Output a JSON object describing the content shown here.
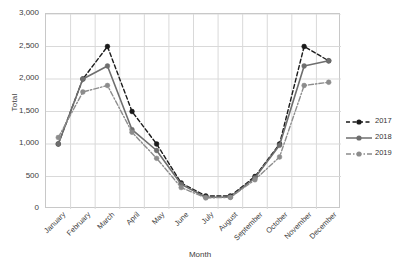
{
  "chart_data": {
    "type": "line",
    "title": "",
    "xlabel": "Month",
    "ylabel": "Total",
    "categories": [
      "January",
      "February",
      "March",
      "April",
      "May",
      "June",
      "July",
      "August",
      "September",
      "October",
      "November",
      "December"
    ],
    "ylim": [
      0,
      3000
    ],
    "ytick_step": 500,
    "ytick_labels": [
      "0",
      "500",
      "1,000",
      "1,500",
      "2,000",
      "2,500",
      "3,000"
    ],
    "ytick_values": [
      0,
      500,
      1000,
      1500,
      2000,
      2500,
      3000
    ],
    "grid": true,
    "legend_position": "right",
    "series": [
      {
        "name": "2017",
        "color": "#1a1a1a",
        "style": "dashed",
        "marker": "circle",
        "values": [
          1000,
          2000,
          2500,
          1500,
          1000,
          400,
          200,
          200,
          500,
          1000,
          2500,
          2280
        ]
      },
      {
        "name": "2018",
        "color": "#6e6e6e",
        "style": "solid",
        "marker": "circle",
        "values": [
          1000,
          2000,
          2200,
          1220,
          900,
          380,
          180,
          180,
          480,
          980,
          2200,
          2280
        ]
      },
      {
        "name": "2019",
        "color": "#8c8c8c",
        "style": "dashdot",
        "marker": "circle",
        "values": [
          1100,
          1800,
          1900,
          1180,
          780,
          330,
          170,
          180,
          450,
          800,
          1900,
          1950
        ]
      }
    ]
  },
  "colors": {
    "grid": "#d9d9d9",
    "axis": "#c8c8c8",
    "text": "#404040",
    "series_2017": "#1a1a1a",
    "series_2018": "#6e6e6e",
    "series_2019": "#8c8c8c"
  }
}
